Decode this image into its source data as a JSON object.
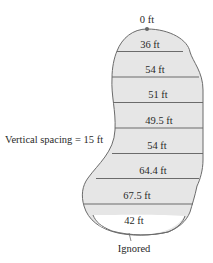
{
  "diagram": {
    "top_label": "0 ft",
    "widths": [
      "36 ft",
      "54 ft",
      "51 ft",
      "49.5 ft",
      "54 ft",
      "64.4 ft",
      "67.5 ft",
      "42 ft"
    ],
    "spacing_label": "Vertical spacing = 15 ft",
    "bottom_label": "Ignored",
    "colors": {
      "fill": "#e6e6e6",
      "outline": "#6b6b6b",
      "dot": "#666666",
      "text": "#2a2a2a"
    }
  }
}
